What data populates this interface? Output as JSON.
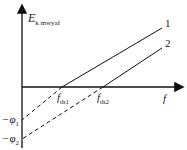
{
  "diagram": {
    "y_axis": {
      "symbol": "E",
      "subscript": "k mwyaf"
    },
    "x_axis": {
      "symbol": "f"
    },
    "lines": [
      {
        "label": "1",
        "threshold_symbol": "f",
        "threshold_sub": "th1",
        "intercept_symbol": "−φ",
        "intercept_sub": "1"
      },
      {
        "label": "2",
        "threshold_symbol": "f",
        "threshold_sub": "th2",
        "intercept_symbol": "−φ",
        "intercept_sub": "2"
      }
    ],
    "colors": {
      "line": "#1a1a1a",
      "text": "#222222"
    }
  }
}
